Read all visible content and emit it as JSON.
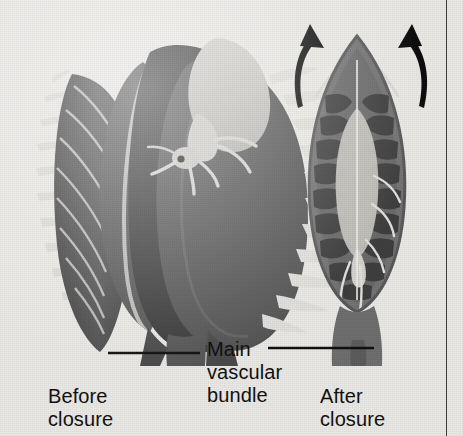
{
  "figure": {
    "background_color": "#eceae6",
    "width": 463,
    "height": 436
  },
  "labels": {
    "main_vascular_bundle": "Main\nvascular\nbundle",
    "before_closure": "Before\nclosure",
    "after_closure": "After\nclosure"
  },
  "specimens": [
    {
      "id": "before",
      "caption": "Before\nclosure",
      "state": "open",
      "description": "Open trap lobes with marginal spikes and an insect resting on the upper lobe",
      "has_insect": true,
      "insect": "grasshopper",
      "lobe_color": "#4a4a4a",
      "inner_color": "#5c5c5c",
      "spike_color": "#d8d6d2",
      "petiole_color": "#5a5a5a"
    },
    {
      "id": "after",
      "caption": "After\nclosure",
      "state": "closed",
      "description": "Closed trap with interlocked spikes, ribbed lobes and the trapped insect visible inside",
      "has_insect": true,
      "insect": "grasshopper",
      "lobe_color": "#6a6a6a",
      "rib_color": "#4a4a4a",
      "insect_color": "#c9c7c2",
      "petiole_color": "#6a6a6a"
    }
  ],
  "annotations": {
    "leader_lines": [
      {
        "name": "leader-line-left",
        "from": "Main vascular bundle label",
        "to": "before-closure petiole"
      },
      {
        "name": "leader-line-right",
        "from": "Main vascular bundle label",
        "to": "after-closure petiole"
      }
    ],
    "motion_arrows": [
      {
        "name": "arrow-left",
        "direction": "up-inward",
        "meaning": "lobe snapping shut"
      },
      {
        "name": "arrow-right",
        "direction": "up-inward",
        "meaning": "lobe snapping shut"
      }
    ]
  },
  "colors": {
    "background": "#eceae6",
    "ink": "#111111",
    "dark_tissue": "#4a4a4a",
    "mid_tissue": "#6a6a6a",
    "light_tissue": "#c9c7c2",
    "highlight": "#e6e4e0",
    "rule": "#3a3a3a"
  }
}
